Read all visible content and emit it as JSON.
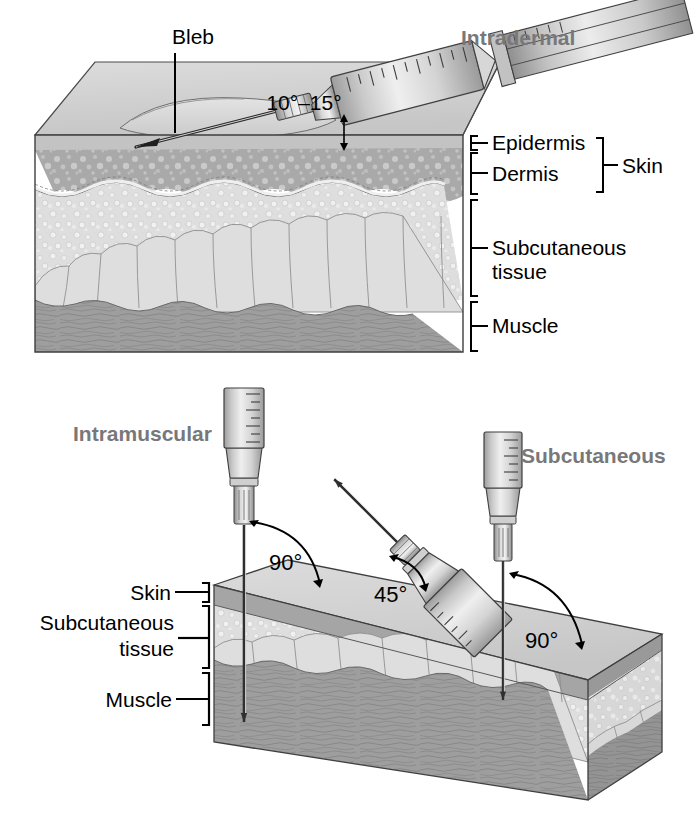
{
  "figure": {
    "title_semantic": "injection-angles-anatomy-illustration",
    "background": "#ffffff",
    "heading_color": "#78787a",
    "text_color": "#000000"
  },
  "panels": [
    {
      "id": "intradermal",
      "heading": "Intradermal",
      "callouts": [
        {
          "name": "bleb",
          "text": "Bleb"
        },
        {
          "name": "angle",
          "text": "10°–15°"
        }
      ],
      "layer_labels": [
        {
          "name": "epidermis",
          "text": "Epidermis"
        },
        {
          "name": "dermis",
          "text": "Dermis"
        },
        {
          "name": "subcutaneous",
          "text": "Subcutaneous",
          "text2": "tissue"
        },
        {
          "name": "muscle",
          "text": "Muscle"
        }
      ],
      "group_labels": [
        {
          "name": "skin",
          "text": "Skin"
        }
      ]
    },
    {
      "id": "im-sc",
      "headings": [
        {
          "name": "intramuscular",
          "text": "Intramuscular"
        },
        {
          "name": "subcutaneous",
          "text": "Subcutaneous"
        }
      ],
      "angles": [
        {
          "name": "intramuscular-angle",
          "text": "90°"
        },
        {
          "name": "subcutaneous-45-angle",
          "text": "45°"
        },
        {
          "name": "subcutaneous-90-angle",
          "text": "90°"
        }
      ],
      "layer_labels": [
        {
          "name": "skin",
          "text": "Skin"
        },
        {
          "name": "subcutaneous",
          "text": "Subcutaneous",
          "text2": "tissue"
        },
        {
          "name": "muscle",
          "text": "Muscle"
        }
      ]
    }
  ],
  "colors": {
    "epidermis": "#b9b9b9",
    "dermis": "#a8a8a8",
    "subcutaneous": "#dcdcdc",
    "fat_lobule": "#d6d6d6",
    "muscle": "#9c9c9c",
    "top_face": "#d2d2d2",
    "outline": "#3a3a3a"
  }
}
